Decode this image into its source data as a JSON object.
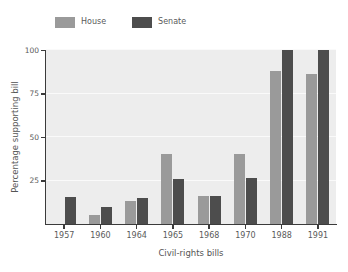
{
  "chart_data": {
    "type": "bar",
    "title": "",
    "subtitle": "",
    "xlabel": "Civil-rights bills",
    "ylabel": "Percentage supporting bill",
    "categories": [
      "1957",
      "1960",
      "1964",
      "1965",
      "1968",
      "1970",
      "1988",
      "1991"
    ],
    "series": [
      {
        "name": "House",
        "color": "#9a9a9a",
        "values": [
          0,
          5,
          13,
          40,
          16,
          40.5,
          88,
          86.5
        ]
      },
      {
        "name": "Senate",
        "color": "#4d4d4d",
        "values": [
          15.5,
          10,
          15,
          26,
          16,
          26.5,
          100,
          100
        ]
      }
    ],
    "ylim": [
      0,
      100
    ],
    "yticks": [
      25,
      50,
      75,
      100
    ],
    "ytick_labels": [
      "25",
      "50",
      "75",
      "100"
    ],
    "grid": true,
    "grid_color": "#fafafa",
    "plot_background": "#ededed",
    "figure_background": "#ffffff",
    "legend_position": "top-left",
    "legend_entries": [
      "House",
      "Senate"
    ]
  },
  "legend": {
    "items": [
      {
        "label": "House"
      },
      {
        "label": "Senate"
      }
    ]
  },
  "axes": {
    "y_title": "Percentage supporting bill",
    "x_title": "Civil-rights bills"
  }
}
